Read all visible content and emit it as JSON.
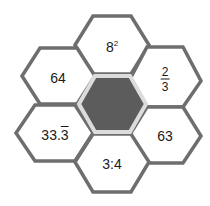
{
  "diagram": {
    "type": "hexagon-cluster",
    "colors": {
      "outline": "#6e6e6e",
      "center_fill": "#5c5c5c",
      "center_border": "#dcdcdc",
      "background": "#ffffff"
    },
    "center": {
      "label": ""
    },
    "cells": {
      "top": {
        "base": "8",
        "exponent": "2"
      },
      "upper_left": {
        "label": "64"
      },
      "upper_right": {
        "numerator": "2",
        "denominator": "3"
      },
      "lower_left": {
        "prefix": "33.",
        "repeating": "3"
      },
      "lower_right": {
        "label": "63"
      },
      "bottom": {
        "label": "3:4"
      }
    }
  }
}
